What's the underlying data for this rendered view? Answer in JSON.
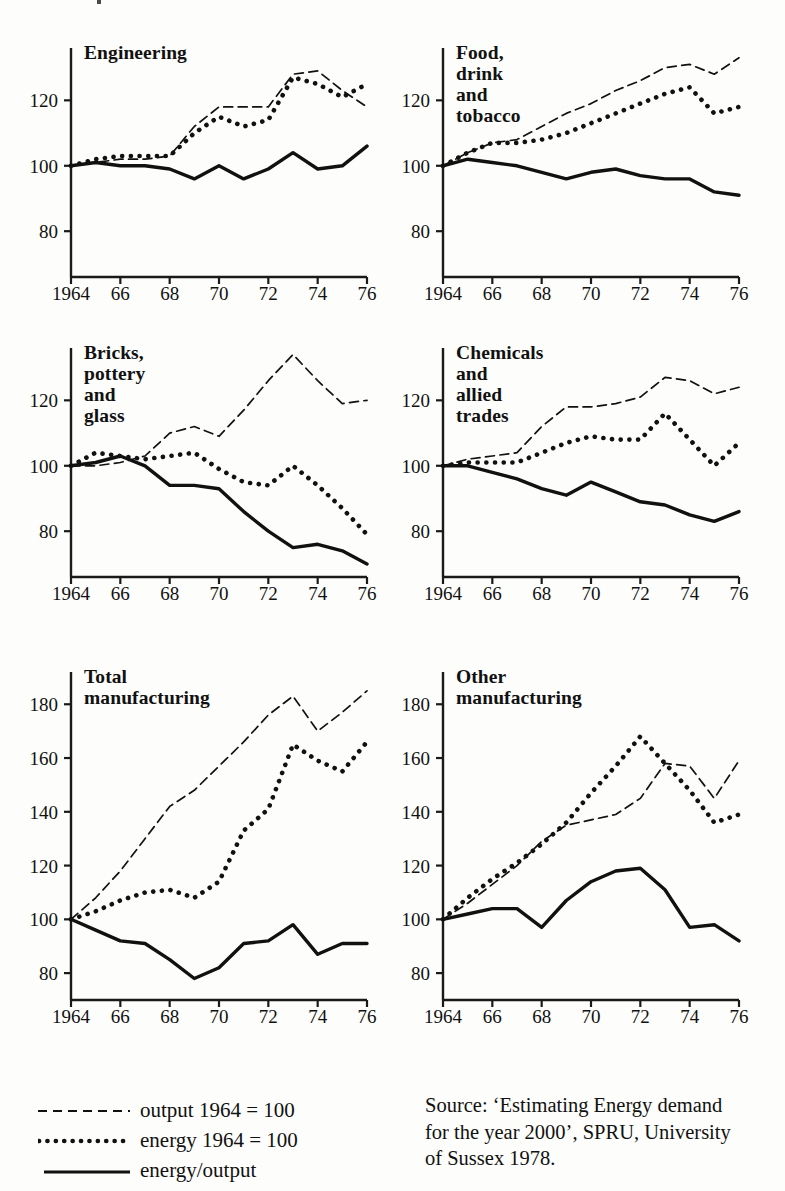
{
  "figure": {
    "legend": {
      "items": [
        {
          "key": "dashed-line-key",
          "label": "output 1964 = 100"
        },
        {
          "key": "dotted-line-key",
          "label": "energy 1964 = 100"
        },
        {
          "key": "solid-line-key",
          "label": "energy/output"
        }
      ]
    },
    "source": {
      "line1": "Source: ‘Estimating Energy demand",
      "line2": "for the year 2000’, SPRU, University",
      "line3": "of Sussex 1978."
    }
  },
  "chart_data": [
    {
      "type": "line",
      "title": "Engineering",
      "xlabel": "",
      "ylabel": "",
      "x": [
        1964,
        1965,
        1966,
        1967,
        1968,
        1969,
        1970,
        1971,
        1972,
        1973,
        1974,
        1975,
        1976
      ],
      "xticks": [
        "1964",
        "66",
        "68",
        "70",
        "72",
        "74",
        "76"
      ],
      "xtickvalues": [
        1964,
        1966,
        1968,
        1970,
        1972,
        1974,
        1976
      ],
      "yticks": [
        80,
        100,
        120
      ],
      "xlim": [
        1964,
        1976
      ],
      "ylim": [
        66,
        136
      ],
      "grid": false,
      "legend_position": "figure-bottom-left",
      "series": [
        {
          "name": "output 1964 = 100",
          "style": "dashed",
          "values": [
            100,
            101,
            102,
            102,
            103,
            112,
            118,
            118,
            118,
            128,
            129,
            123,
            118
          ]
        },
        {
          "name": "energy 1964 = 100",
          "style": "dotted",
          "values": [
            100,
            102,
            103,
            103,
            103,
            110,
            115,
            112,
            114,
            127,
            125,
            121,
            125
          ]
        },
        {
          "name": "energy/output",
          "style": "solid",
          "values": [
            100,
            101,
            100,
            100,
            99,
            96,
            100,
            96,
            99,
            104,
            99,
            100,
            106
          ]
        }
      ]
    },
    {
      "type": "line",
      "title": "Food, drink\nand tobacco",
      "xlabel": "",
      "ylabel": "",
      "x": [
        1964,
        1965,
        1966,
        1967,
        1968,
        1969,
        1970,
        1971,
        1972,
        1973,
        1974,
        1975,
        1976
      ],
      "xticks": [
        "1964",
        "66",
        "68",
        "70",
        "72",
        "74",
        "76"
      ],
      "xtickvalues": [
        1964,
        1966,
        1968,
        1970,
        1972,
        1974,
        1976
      ],
      "yticks": [
        80,
        100,
        120
      ],
      "xlim": [
        1964,
        1976
      ],
      "ylim": [
        66,
        136
      ],
      "grid": false,
      "legend_position": "figure-bottom-left",
      "series": [
        {
          "name": "output 1964 = 100",
          "style": "dashed",
          "values": [
            100,
            104,
            107,
            108,
            112,
            116,
            119,
            123,
            126,
            130,
            131,
            128,
            133
          ]
        },
        {
          "name": "energy 1964 = 100",
          "style": "dotted",
          "values": [
            100,
            104,
            107,
            107,
            108,
            110,
            113,
            116,
            119,
            122,
            124,
            116,
            118
          ]
        },
        {
          "name": "energy/output",
          "style": "solid",
          "values": [
            100,
            102,
            101,
            100,
            98,
            96,
            98,
            99,
            97,
            96,
            96,
            92,
            91
          ]
        }
      ]
    },
    {
      "type": "line",
      "title": "Bricks, pottery\nand glass",
      "xlabel": "",
      "ylabel": "",
      "x": [
        1964,
        1965,
        1966,
        1967,
        1968,
        1969,
        1970,
        1971,
        1972,
        1973,
        1974,
        1975,
        1976
      ],
      "xticks": [
        "1964",
        "66",
        "68",
        "70",
        "72",
        "74",
        "76"
      ],
      "xtickvalues": [
        1964,
        1966,
        1968,
        1970,
        1972,
        1974,
        1976
      ],
      "yticks": [
        80,
        100,
        120
      ],
      "xlim": [
        1964,
        1976
      ],
      "ylim": [
        66,
        136
      ],
      "grid": false,
      "legend_position": "figure-bottom-left",
      "series": [
        {
          "name": "output 1964 = 100",
          "style": "dashed",
          "values": [
            100,
            100,
            101,
            103,
            110,
            112,
            109,
            117,
            126,
            134,
            126,
            119,
            120
          ]
        },
        {
          "name": "energy 1964 = 100",
          "style": "dotted",
          "values": [
            100,
            104,
            103,
            102,
            103,
            104,
            99,
            95,
            94,
            100,
            94,
            87,
            79
          ]
        },
        {
          "name": "energy/output",
          "style": "solid",
          "values": [
            100,
            101,
            103,
            100,
            94,
            94,
            93,
            86,
            80,
            75,
            76,
            74,
            70
          ]
        }
      ]
    },
    {
      "type": "line",
      "title": "Chemicals and\nallied trades",
      "xlabel": "",
      "ylabel": "",
      "x": [
        1964,
        1965,
        1966,
        1967,
        1968,
        1969,
        1970,
        1971,
        1972,
        1973,
        1974,
        1975,
        1976
      ],
      "xticks": [
        "1964",
        "66",
        "68",
        "70",
        "72",
        "74",
        "76"
      ],
      "xtickvalues": [
        1964,
        1966,
        1968,
        1970,
        1972,
        1974,
        1976
      ],
      "yticks": [
        80,
        100,
        120
      ],
      "xlim": [
        1964,
        1976
      ],
      "ylim": [
        66,
        136
      ],
      "grid": false,
      "legend_position": "figure-bottom-left",
      "series": [
        {
          "name": "output 1964 = 100",
          "style": "dashed",
          "values": [
            100,
            102,
            103,
            104,
            112,
            118,
            118,
            119,
            121,
            127,
            126,
            122,
            124
          ]
        },
        {
          "name": "energy 1964 = 100",
          "style": "dotted",
          "values": [
            100,
            101,
            101,
            101,
            104,
            107,
            109,
            108,
            108,
            116,
            108,
            100,
            107
          ]
        },
        {
          "name": "energy/output",
          "style": "solid",
          "values": [
            100,
            100,
            98,
            96,
            93,
            91,
            95,
            92,
            89,
            88,
            85,
            83,
            86
          ]
        }
      ]
    },
    {
      "type": "line",
      "title": "Total\nmanufacturing",
      "xlabel": "",
      "ylabel": "",
      "x": [
        1964,
        1965,
        1966,
        1967,
        1968,
        1969,
        1970,
        1971,
        1972,
        1973,
        1974,
        1975,
        1976
      ],
      "xticks": [
        "1964",
        "66",
        "68",
        "70",
        "72",
        "74",
        "76"
      ],
      "xtickvalues": [
        1964,
        1966,
        1968,
        1970,
        1972,
        1974,
        1976
      ],
      "yticks": [
        80,
        100,
        120,
        140,
        160,
        180
      ],
      "xlim": [
        1964,
        1976
      ],
      "ylim": [
        70,
        192
      ],
      "grid": false,
      "legend_position": "figure-bottom-left",
      "series": [
        {
          "name": "output 1964 = 100",
          "style": "dashed",
          "values": [
            100,
            108,
            118,
            130,
            142,
            148,
            157,
            166,
            176,
            183,
            170,
            177,
            185
          ]
        },
        {
          "name": "energy 1964 = 100",
          "style": "dotted",
          "values": [
            100,
            103,
            107,
            110,
            111,
            108,
            114,
            133,
            141,
            165,
            159,
            155,
            166
          ]
        },
        {
          "name": "energy/output",
          "style": "solid",
          "values": [
            100,
            96,
            92,
            91,
            85,
            78,
            82,
            91,
            92,
            98,
            87,
            91,
            91
          ]
        }
      ]
    },
    {
      "type": "line",
      "title": "Other\nmanufacturing",
      "xlabel": "",
      "ylabel": "",
      "x": [
        1964,
        1965,
        1966,
        1967,
        1968,
        1969,
        1970,
        1971,
        1972,
        1973,
        1974,
        1975,
        1976
      ],
      "xticks": [
        "1964",
        "66",
        "68",
        "70",
        "72",
        "74",
        "76"
      ],
      "xtickvalues": [
        1964,
        1966,
        1968,
        1970,
        1972,
        1974,
        1976
      ],
      "yticks": [
        80,
        100,
        120,
        140,
        160,
        180
      ],
      "xlim": [
        1964,
        1976
      ],
      "ylim": [
        70,
        192
      ],
      "grid": false,
      "legend_position": "figure-bottom-left",
      "series": [
        {
          "name": "output 1964 = 100",
          "style": "dashed",
          "values": [
            100,
            106,
            113,
            120,
            129,
            135,
            137,
            139,
            145,
            158,
            157,
            145,
            159
          ]
        },
        {
          "name": "energy 1964 = 100",
          "style": "dotted",
          "values": [
            100,
            108,
            115,
            121,
            128,
            136,
            147,
            157,
            168,
            158,
            148,
            136,
            139
          ]
        },
        {
          "name": "energy/output",
          "style": "solid",
          "values": [
            100,
            102,
            104,
            104,
            97,
            107,
            114,
            118,
            119,
            111,
            97,
            98,
            92
          ]
        }
      ]
    }
  ]
}
